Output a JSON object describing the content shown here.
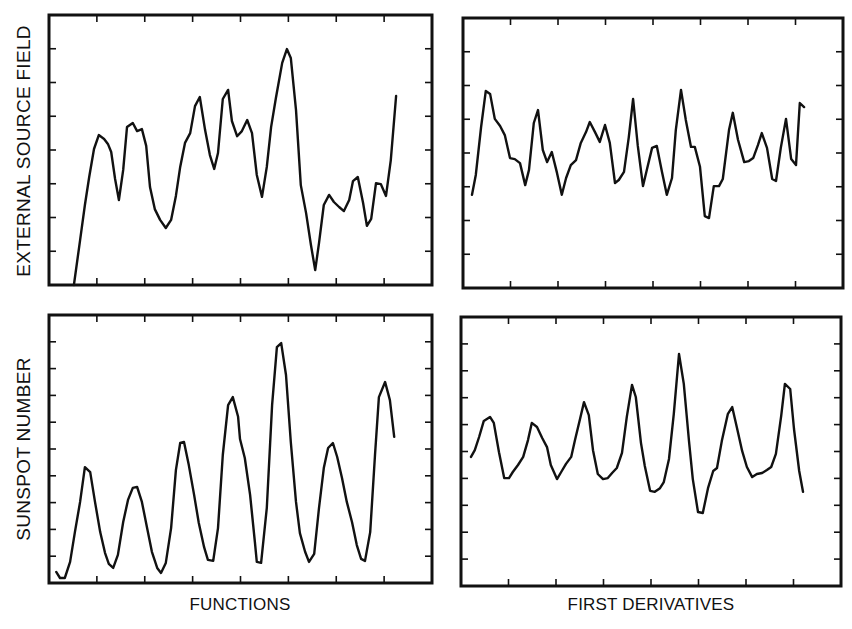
{
  "figure": {
    "row_labels": [
      "EXTERNAL SOURCE FIELD",
      "SUNSPOT NUMBER"
    ],
    "column_labels": [
      "FUNCTIONS",
      "FIRST DERIVATIVES"
    ],
    "line_color": "#111111",
    "frame_color": "#111111",
    "background": "#ffffff"
  },
  "chart_data": [
    {
      "type": "line",
      "title": "",
      "row": "EXTERNAL SOURCE FIELD",
      "column": "FUNCTIONS",
      "xlabel": "",
      "ylabel": "EXTERNAL SOURCE FIELD",
      "units": "tick intervals (no numeric tick labels shown)",
      "xlim": [
        0,
        8
      ],
      "ylim": [
        0,
        8
      ],
      "grid": false,
      "ticks": {
        "x_count": 7,
        "y_count": 7,
        "sides": [
          "top",
          "bottom",
          "left",
          "right"
        ]
      },
      "frame": {
        "x": 49,
        "y": 15,
        "w": 383,
        "h": 270
      },
      "points": [
        [
          0.52,
          0.0
        ],
        [
          0.65,
          1.33
        ],
        [
          0.75,
          2.37
        ],
        [
          0.84,
          3.2
        ],
        [
          0.94,
          4.03
        ],
        [
          1.04,
          4.44
        ],
        [
          1.15,
          4.33
        ],
        [
          1.23,
          4.18
        ],
        [
          1.3,
          3.94
        ],
        [
          1.38,
          3.14
        ],
        [
          1.46,
          2.52
        ],
        [
          1.55,
          3.41
        ],
        [
          1.63,
          4.68
        ],
        [
          1.75,
          4.8
        ],
        [
          1.84,
          4.56
        ],
        [
          1.94,
          4.62
        ],
        [
          2.03,
          4.12
        ],
        [
          2.11,
          2.9
        ],
        [
          2.21,
          2.25
        ],
        [
          2.32,
          1.93
        ],
        [
          2.44,
          1.69
        ],
        [
          2.55,
          1.93
        ],
        [
          2.65,
          2.64
        ],
        [
          2.74,
          3.5
        ],
        [
          2.84,
          4.21
        ],
        [
          2.95,
          4.5
        ],
        [
          3.05,
          5.3
        ],
        [
          3.15,
          5.57
        ],
        [
          3.26,
          4.59
        ],
        [
          3.36,
          3.85
        ],
        [
          3.45,
          3.44
        ],
        [
          3.53,
          3.91
        ],
        [
          3.63,
          5.51
        ],
        [
          3.74,
          5.78
        ],
        [
          3.82,
          4.86
        ],
        [
          3.93,
          4.41
        ],
        [
          4.03,
          4.56
        ],
        [
          4.14,
          4.89
        ],
        [
          4.24,
          4.5
        ],
        [
          4.34,
          3.26
        ],
        [
          4.45,
          2.61
        ],
        [
          4.55,
          3.5
        ],
        [
          4.64,
          4.68
        ],
        [
          4.74,
          5.54
        ],
        [
          4.87,
          6.58
        ],
        [
          4.97,
          6.99
        ],
        [
          5.05,
          6.73
        ],
        [
          5.16,
          5.19
        ],
        [
          5.26,
          2.96
        ],
        [
          5.37,
          2.13
        ],
        [
          5.47,
          1.19
        ],
        [
          5.56,
          0.44
        ],
        [
          5.64,
          1.24
        ],
        [
          5.74,
          2.37
        ],
        [
          5.85,
          2.67
        ],
        [
          5.95,
          2.46
        ],
        [
          6.06,
          2.31
        ],
        [
          6.16,
          2.19
        ],
        [
          6.27,
          2.52
        ],
        [
          6.35,
          3.08
        ],
        [
          6.45,
          3.2
        ],
        [
          6.56,
          2.43
        ],
        [
          6.64,
          1.75
        ],
        [
          6.73,
          1.96
        ],
        [
          6.83,
          3.02
        ],
        [
          6.93,
          2.99
        ],
        [
          7.04,
          2.64
        ],
        [
          7.14,
          3.7
        ],
        [
          7.25,
          5.6
        ]
      ]
    },
    {
      "type": "line",
      "title": "",
      "row": "EXTERNAL SOURCE FIELD",
      "column": "FIRST DERIVATIVES",
      "xlabel": "",
      "ylabel": "",
      "units": "tick intervals (no numeric tick labels shown)",
      "xlim": [
        0,
        8
      ],
      "ylim": [
        0,
        8
      ],
      "grid": false,
      "ticks": {
        "x_count": 7,
        "y_count": 7,
        "sides": [
          "top",
          "bottom",
          "left",
          "right"
        ]
      },
      "frame": {
        "x": 463,
        "y": 18,
        "w": 380,
        "h": 270
      },
      "points": [
        [
          0.19,
          2.76
        ],
        [
          0.27,
          3.35
        ],
        [
          0.38,
          4.77
        ],
        [
          0.48,
          5.84
        ],
        [
          0.57,
          5.75
        ],
        [
          0.67,
          5.01
        ],
        [
          0.78,
          4.8
        ],
        [
          0.88,
          4.53
        ],
        [
          0.99,
          3.85
        ],
        [
          1.09,
          3.82
        ],
        [
          1.2,
          3.7
        ],
        [
          1.31,
          3.05
        ],
        [
          1.39,
          3.5
        ],
        [
          1.49,
          4.89
        ],
        [
          1.58,
          5.27
        ],
        [
          1.68,
          4.09
        ],
        [
          1.77,
          3.73
        ],
        [
          1.87,
          4.03
        ],
        [
          1.98,
          3.41
        ],
        [
          2.08,
          2.76
        ],
        [
          2.17,
          3.26
        ],
        [
          2.27,
          3.64
        ],
        [
          2.38,
          3.79
        ],
        [
          2.48,
          4.3
        ],
        [
          2.59,
          4.62
        ],
        [
          2.67,
          4.92
        ],
        [
          2.78,
          4.62
        ],
        [
          2.88,
          4.33
        ],
        [
          2.99,
          4.83
        ],
        [
          3.09,
          4.3
        ],
        [
          3.2,
          3.11
        ],
        [
          3.28,
          3.2
        ],
        [
          3.39,
          3.44
        ],
        [
          3.49,
          4.47
        ],
        [
          3.58,
          5.6
        ],
        [
          3.68,
          4.21
        ],
        [
          3.79,
          3.02
        ],
        [
          3.87,
          3.5
        ],
        [
          3.98,
          4.15
        ],
        [
          4.08,
          4.21
        ],
        [
          4.19,
          3.44
        ],
        [
          4.29,
          2.76
        ],
        [
          4.4,
          3.26
        ],
        [
          4.48,
          4.68
        ],
        [
          4.59,
          5.87
        ],
        [
          4.69,
          4.98
        ],
        [
          4.8,
          4.18
        ],
        [
          4.88,
          4.18
        ],
        [
          4.99,
          3.59
        ],
        [
          5.09,
          2.13
        ],
        [
          5.18,
          2.07
        ],
        [
          5.28,
          3.02
        ],
        [
          5.39,
          3.02
        ],
        [
          5.47,
          3.23
        ],
        [
          5.6,
          4.68
        ],
        [
          5.68,
          5.19
        ],
        [
          5.79,
          4.39
        ],
        [
          5.92,
          3.73
        ],
        [
          6.02,
          3.76
        ],
        [
          6.11,
          3.85
        ],
        [
          6.21,
          4.24
        ],
        [
          6.29,
          4.59
        ],
        [
          6.4,
          4.15
        ],
        [
          6.51,
          3.23
        ],
        [
          6.59,
          3.17
        ],
        [
          6.69,
          4.15
        ],
        [
          6.8,
          5.01
        ],
        [
          6.91,
          3.82
        ],
        [
          7.01,
          3.64
        ],
        [
          7.09,
          5.48
        ],
        [
          7.18,
          5.36
        ]
      ]
    },
    {
      "type": "line",
      "title": "",
      "row": "SUNSPOT NUMBER",
      "column": "FUNCTIONS",
      "xlabel": "FUNCTIONS",
      "ylabel": "SUNSPOT NUMBER",
      "units": "tick intervals (no numeric tick labels shown)",
      "xlim": [
        0,
        8
      ],
      "ylim": [
        0,
        8
      ],
      "grid": false,
      "ticks": {
        "x_count": 7,
        "y_count": 9,
        "sides": [
          "top",
          "bottom",
          "left",
          "right"
        ]
      },
      "frame": {
        "x": 49,
        "y": 315,
        "w": 383,
        "h": 268
      },
      "points": [
        [
          0.15,
          0.33
        ],
        [
          0.23,
          0.15
        ],
        [
          0.33,
          0.15
        ],
        [
          0.44,
          0.63
        ],
        [
          0.54,
          1.52
        ],
        [
          0.65,
          2.42
        ],
        [
          0.75,
          3.46
        ],
        [
          0.86,
          3.31
        ],
        [
          0.96,
          2.42
        ],
        [
          1.07,
          1.52
        ],
        [
          1.17,
          0.9
        ],
        [
          1.25,
          0.57
        ],
        [
          1.34,
          0.45
        ],
        [
          1.44,
          0.84
        ],
        [
          1.55,
          1.82
        ],
        [
          1.65,
          2.48
        ],
        [
          1.75,
          2.84
        ],
        [
          1.84,
          2.87
        ],
        [
          1.94,
          2.42
        ],
        [
          2.05,
          1.64
        ],
        [
          2.15,
          0.93
        ],
        [
          2.26,
          0.45
        ],
        [
          2.34,
          0.3
        ],
        [
          2.44,
          0.6
        ],
        [
          2.55,
          1.64
        ],
        [
          2.65,
          3.37
        ],
        [
          2.74,
          4.18
        ],
        [
          2.82,
          4.21
        ],
        [
          2.92,
          3.52
        ],
        [
          3.03,
          2.63
        ],
        [
          3.13,
          1.79
        ],
        [
          3.24,
          1.07
        ],
        [
          3.32,
          0.69
        ],
        [
          3.43,
          0.66
        ],
        [
          3.53,
          1.64
        ],
        [
          3.63,
          3.82
        ],
        [
          3.74,
          5.31
        ],
        [
          3.84,
          5.55
        ],
        [
          3.95,
          4.96
        ],
        [
          3.99,
          4.3
        ],
        [
          4.09,
          3.73
        ],
        [
          4.2,
          2.63
        ],
        [
          4.3,
          1.22
        ],
        [
          4.34,
          0.63
        ],
        [
          4.43,
          0.6
        ],
        [
          4.55,
          2.24
        ],
        [
          4.66,
          5.31
        ],
        [
          4.76,
          7.04
        ],
        [
          4.85,
          7.16
        ],
        [
          4.95,
          6.21
        ],
        [
          5.05,
          4.21
        ],
        [
          5.16,
          2.42
        ],
        [
          5.24,
          1.49
        ],
        [
          5.35,
          0.93
        ],
        [
          5.43,
          0.63
        ],
        [
          5.54,
          0.87
        ],
        [
          5.64,
          2.24
        ],
        [
          5.74,
          3.43
        ],
        [
          5.83,
          4.03
        ],
        [
          5.93,
          4.18
        ],
        [
          6.02,
          3.76
        ],
        [
          6.12,
          3.13
        ],
        [
          6.22,
          2.42
        ],
        [
          6.33,
          1.82
        ],
        [
          6.43,
          1.13
        ],
        [
          6.52,
          0.72
        ],
        [
          6.6,
          0.66
        ],
        [
          6.71,
          1.52
        ],
        [
          6.81,
          3.82
        ],
        [
          6.89,
          5.55
        ],
        [
          7.02,
          6.0
        ],
        [
          7.12,
          5.46
        ],
        [
          7.21,
          4.36
        ]
      ]
    },
    {
      "type": "line",
      "title": "",
      "row": "SUNSPOT NUMBER",
      "column": "FIRST DERIVATIVES",
      "xlabel": "FIRST DERIVATIVES",
      "ylabel": "",
      "units": "tick intervals (no numeric tick labels shown)",
      "xlim": [
        0,
        8
      ],
      "ylim": [
        0,
        8
      ],
      "grid": false,
      "ticks": {
        "x_count": 7,
        "y_count": 9,
        "sides": [
          "top",
          "bottom",
          "left",
          "right"
        ]
      },
      "frame": {
        "x": 461,
        "y": 317,
        "w": 380,
        "h": 269
      },
      "points": [
        [
          0.21,
          3.84
        ],
        [
          0.29,
          4.04
        ],
        [
          0.38,
          4.43
        ],
        [
          0.48,
          4.91
        ],
        [
          0.61,
          5.03
        ],
        [
          0.69,
          4.85
        ],
        [
          0.8,
          3.98
        ],
        [
          0.91,
          3.21
        ],
        [
          1.01,
          3.21
        ],
        [
          1.09,
          3.39
        ],
        [
          1.2,
          3.6
        ],
        [
          1.31,
          3.84
        ],
        [
          1.41,
          4.34
        ],
        [
          1.49,
          4.85
        ],
        [
          1.6,
          4.73
        ],
        [
          1.71,
          4.4
        ],
        [
          1.81,
          4.13
        ],
        [
          1.89,
          3.6
        ],
        [
          2.02,
          3.18
        ],
        [
          2.11,
          3.39
        ],
        [
          2.21,
          3.63
        ],
        [
          2.32,
          3.84
        ],
        [
          2.4,
          4.34
        ],
        [
          2.51,
          4.99
        ],
        [
          2.59,
          5.47
        ],
        [
          2.69,
          5.08
        ],
        [
          2.78,
          4.04
        ],
        [
          2.88,
          3.33
        ],
        [
          2.99,
          3.18
        ],
        [
          3.09,
          3.21
        ],
        [
          3.18,
          3.36
        ],
        [
          3.28,
          3.51
        ],
        [
          3.39,
          3.96
        ],
        [
          3.49,
          5.03
        ],
        [
          3.6,
          5.98
        ],
        [
          3.68,
          5.62
        ],
        [
          3.79,
          4.25
        ],
        [
          3.87,
          3.57
        ],
        [
          3.98,
          2.83
        ],
        [
          4.08,
          2.8
        ],
        [
          4.19,
          2.91
        ],
        [
          4.27,
          3.09
        ],
        [
          4.38,
          3.78
        ],
        [
          4.48,
          5.12
        ],
        [
          4.59,
          6.9
        ],
        [
          4.69,
          6.01
        ],
        [
          4.8,
          4.31
        ],
        [
          4.88,
          3.18
        ],
        [
          4.99,
          2.2
        ],
        [
          5.09,
          2.17
        ],
        [
          5.2,
          2.91
        ],
        [
          5.31,
          3.42
        ],
        [
          5.39,
          3.51
        ],
        [
          5.49,
          4.31
        ],
        [
          5.62,
          5.12
        ],
        [
          5.71,
          5.32
        ],
        [
          5.81,
          4.7
        ],
        [
          5.92,
          4.01
        ],
        [
          6.02,
          3.54
        ],
        [
          6.13,
          3.24
        ],
        [
          6.23,
          3.33
        ],
        [
          6.34,
          3.36
        ],
        [
          6.44,
          3.45
        ],
        [
          6.53,
          3.54
        ],
        [
          6.63,
          3.93
        ],
        [
          6.74,
          5.06
        ],
        [
          6.82,
          6.01
        ],
        [
          6.93,
          5.86
        ],
        [
          7.01,
          4.67
        ],
        [
          7.12,
          3.42
        ],
        [
          7.2,
          2.8
        ]
      ]
    }
  ]
}
